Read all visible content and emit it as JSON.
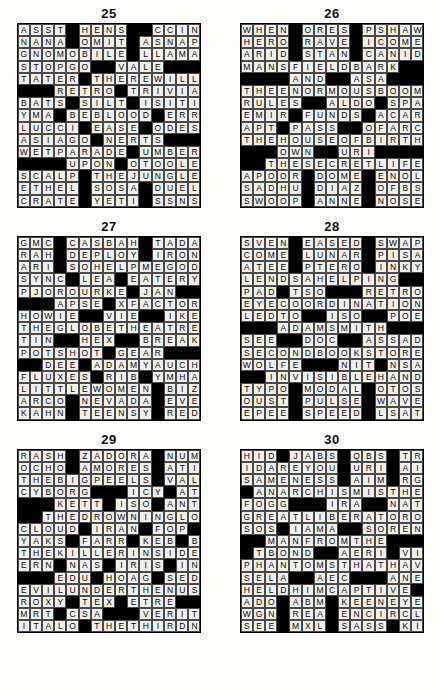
{
  "page": {
    "columns": 15,
    "rows": 15,
    "block_char": "#",
    "colors": {
      "block": "#000000",
      "cell": "#f0efea",
      "text": "#0a0a0a",
      "page_background": "#ffffff"
    }
  },
  "puzzles": [
    {
      "number": "25",
      "rows": [
        "ASST#HENS##CCING",
        "NANA#OMIT#ASNAP",
        "GNOMOBILE#LLAMA",
        "STOPGO##VALE###",
        "TATER#THEREWILL",
        "###RETRO#TRIVIA",
        "BATS#SILT#ISITI",
        "YMA#BEBLOOD#ERR",
        "LUCCI#EASE#ODES",
        "ASIAGO#NERTS###",
        "WETPARADE#UMBER",
        "####UPON#OTOOLE",
        "SCALP#THEJUNGLE",
        "ETHEL#SOSA#DUEL",
        "CRATE#YETI#SSNS"
      ]
    },
    {
      "number": "26",
      "rows": [
        "WHEN#ORES#PSHAW",
        "HERO#RAVE#ICOME",
        "ARID#STAN#CANID",
        "MANSFIELDBARK##",
        "####AND##ASA###",
        "THEENORMOUSBOOM",
        "RULES##ALDO#SPA",
        "EMIR#FUNDS#ACAR",
        "APT#PASS##OFARC",
        "THEHOUSEOFBIRTH",
        "###OWN##URI####",
        "##THESECRETLIFE",
        "APOOR#DOME#ENOL",
        "SADHU#DIAZ#OFBS",
        "SWOOP#ANNE#NOSE"
      ]
    },
    {
      "number": "27",
      "rows": [
        "GMC#CASBAH#TADA",
        "RAH#DEPLOY#IRON",
        "ARI#SOHELPMEGOD",
        "SYNC#LEA#EATERY",
        "PJOROURKE#JAN##",
        "###APSE#XFACTOR",
        "HOWIE##VIE##IKE",
        "THEGLOBETHEATRE",
        "TIN##HEX##BREAK",
        "POTSHOT#GEAR###",
        "##DEE#ADAMYAUCH",
        "FLUXES#RIB#YMHA",
        "LITTLEWOMEN#BIZ",
        "ARCO#NEVADA#EVE",
        "KAHN#TEENSY#RED"
      ]
    },
    {
      "number": "28",
      "rows": [
        "SVEN#EASED#SWAP",
        "COME#LUNAR#PISA",
        "ATEE#PTERO#INKY",
        "LENDSAHELPING##",
        "PAD#TSO###RETRO",
        "EYECOORDINATION",
        "LEDTO##ISO##POE",
        "###ADAMSMITH###",
        "SEE##DOC##ASSAD",
        "SECONDBOOKSTORE",
        "WOLFE###NIT#NSA",
        "##INVISIBLEHAND",
        "TYPO#MODAL#OTOS",
        "OUST#PULSE#WAVE",
        "EPEE#SPEED#LSAT"
      ]
    },
    {
      "number": "29",
      "rows": [
        "RASH#ZADORA#NUMBS",
        "OCHO#AMORES#ATILT",
        "THEBIGPEELS#VALOR",
        "CYBORG###ICY#ATE",
        "###KETT#ISO#ANTE",
        "##THEDROWNINGLOOP",
        "CLOUD#IRAN#FOP###",
        "YAKS#FARR#KEB#BMX",
        "THEKILLERINSIDEEM",
        "ERN#NAS#IRIS#INGE",
        "###EDU#HOAG#SEDAN",
        "EVILUNDERTHENUS##",
        "ROXY#TEX#ETRE####",
        "MRT#CSA###VERITE",
        "ITALO#THETHIRDNAM",
        "NEPAL#HARKEN#ATOM"
      ]
    },
    {
      "number": "30",
      "rows": [
        "HID#JABS#QBS#TRI",
        "IDAREYOU#URI#AIT",
        "SAMENESS#AIM#RGS",
        "#ANARCHISMISTHE",
        "FOGG###IRA##NATL",
        "GREATLIBERATOROF",
        "SOS#IAMA##SOREN#",
        "##MANFROMTHE###",
        "#TBOND##AERI#VIP",
        "PHANTOMSTHATHAVE",
        "SELA##AEC###ANEW",
        "HELDHIMCAPTIVE##",
        "ADO#ABM#KEENEYED",
        "WGN#REA#ENCIRCLE",
        "SEE#MXL#SASS#KIN"
      ]
    }
  ]
}
